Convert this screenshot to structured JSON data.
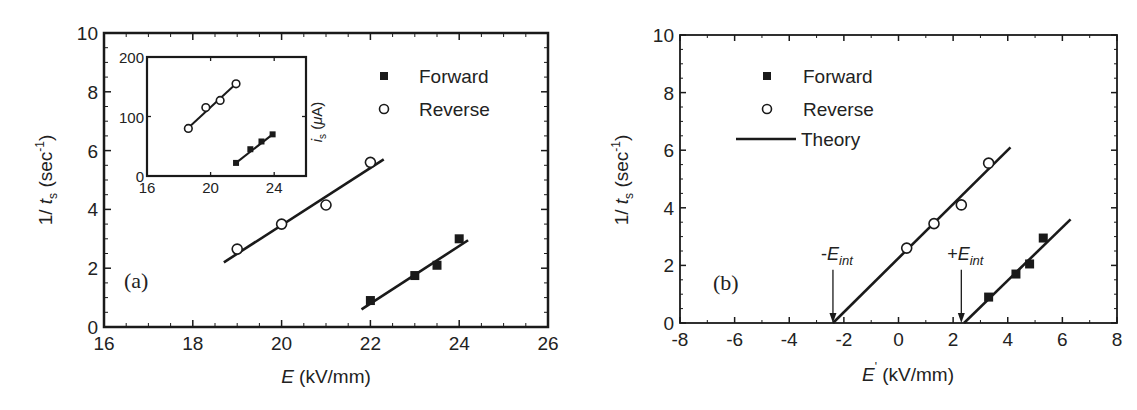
{
  "chart_data": [
    {
      "type": "scatter",
      "panel": "(a)",
      "xlabel": "E (kV/mm)",
      "xlabel_italic": "E",
      "xlabel_unit": "(kV/mm)",
      "ylabel": "1/ t_s (sec^-1)",
      "xlim": [
        16,
        26
      ],
      "ylim": [
        0,
        10
      ],
      "xticks": [
        "16",
        "18",
        "20",
        "22",
        "24",
        "26"
      ],
      "yticks": [
        "0",
        "2",
        "4",
        "6",
        "8",
        "10"
      ],
      "legend": [
        {
          "label": "Forward",
          "marker": "filled-square"
        },
        {
          "label": "Reverse",
          "marker": "open-circle"
        }
      ],
      "legend_position": "upper right",
      "series": [
        {
          "name": "Forward",
          "marker": "filled-square",
          "x": [
            22,
            23,
            23.5,
            24
          ],
          "y": [
            0.9,
            1.75,
            2.1,
            3.0
          ],
          "fit_line": {
            "x": [
              21.8,
              24.2
            ],
            "y": [
              0.6,
              2.95
            ]
          }
        },
        {
          "name": "Reverse",
          "marker": "open-circle",
          "x": [
            19,
            20,
            21,
            22
          ],
          "y": [
            2.65,
            3.5,
            4.15,
            5.6
          ],
          "fit_line": {
            "x": [
              18.7,
              22.3
            ],
            "y": [
              2.2,
              5.7
            ]
          }
        }
      ],
      "inset": {
        "ylabel": "i_s (μA)",
        "xlim": [
          16,
          26
        ],
        "ylim": [
          0,
          200
        ],
        "xticks": [
          "16",
          "20",
          "24"
        ],
        "yticks": [
          "0",
          "100",
          "200"
        ],
        "series": [
          {
            "name": "Reverse",
            "marker": "open-circle",
            "x": [
              18.6,
              19.7,
              20.6,
              21.6
            ],
            "y": [
              80,
              115,
              127,
              155
            ],
            "fit_line": {
              "x": [
                18.4,
                21.8
              ],
              "y": [
                76,
                160
              ]
            }
          },
          {
            "name": "Forward",
            "marker": "filled-square",
            "x": [
              21.6,
              22.5,
              23.2,
              23.9
            ],
            "y": [
              22,
              45,
              58,
              70
            ],
            "fit_line": {
              "x": [
                21.5,
                24.0
              ],
              "y": [
                20,
                72
              ]
            }
          }
        ]
      }
    },
    {
      "type": "scatter",
      "panel": "(b)",
      "xlabel": "E' (kV/mm)",
      "xlabel_italic": "E",
      "xlabel_prime": "'",
      "xlabel_unit": "(kV/mm)",
      "ylabel": "1/ t_s (sec^-1)",
      "xlim": [
        -8,
        8
      ],
      "ylim": [
        0,
        10
      ],
      "xticks": [
        "-8",
        "-6",
        "-4",
        "-2",
        "0",
        "2",
        "4",
        "6",
        "8"
      ],
      "yticks": [
        "0",
        "2",
        "4",
        "6",
        "8",
        "10"
      ],
      "legend": [
        {
          "label": "Forward",
          "marker": "filled-square"
        },
        {
          "label": "Reverse",
          "marker": "open-circle"
        },
        {
          "label": "Theory",
          "marker": "line"
        }
      ],
      "legend_position": "upper left",
      "series": [
        {
          "name": "Forward",
          "marker": "filled-square",
          "x": [
            3.3,
            4.3,
            4.8,
            5.3
          ],
          "y": [
            0.9,
            1.7,
            2.05,
            2.95
          ]
        },
        {
          "name": "Reverse",
          "marker": "open-circle",
          "x": [
            0.3,
            1.3,
            2.3,
            3.3
          ],
          "y": [
            2.6,
            3.45,
            4.1,
            5.55
          ]
        },
        {
          "name": "Theory (reverse)",
          "marker": "line",
          "x": [
            -2.4,
            4.1
          ],
          "y": [
            0,
            6.1
          ]
        },
        {
          "name": "Theory (forward)",
          "marker": "line",
          "x": [
            2.4,
            6.3
          ],
          "y": [
            0,
            3.6
          ]
        }
      ],
      "annotations": [
        {
          "text": "-E_int",
          "prefix": "-",
          "main": "E",
          "sub": "int",
          "arrow_x": -2.4,
          "arrow_from_y": 1.85,
          "arrow_to_y": 0
        },
        {
          "text": "+E_int",
          "prefix": "+",
          "main": "E",
          "sub": "int",
          "arrow_x": 2.3,
          "arrow_from_y": 1.85,
          "arrow_to_y": 0
        }
      ]
    }
  ]
}
